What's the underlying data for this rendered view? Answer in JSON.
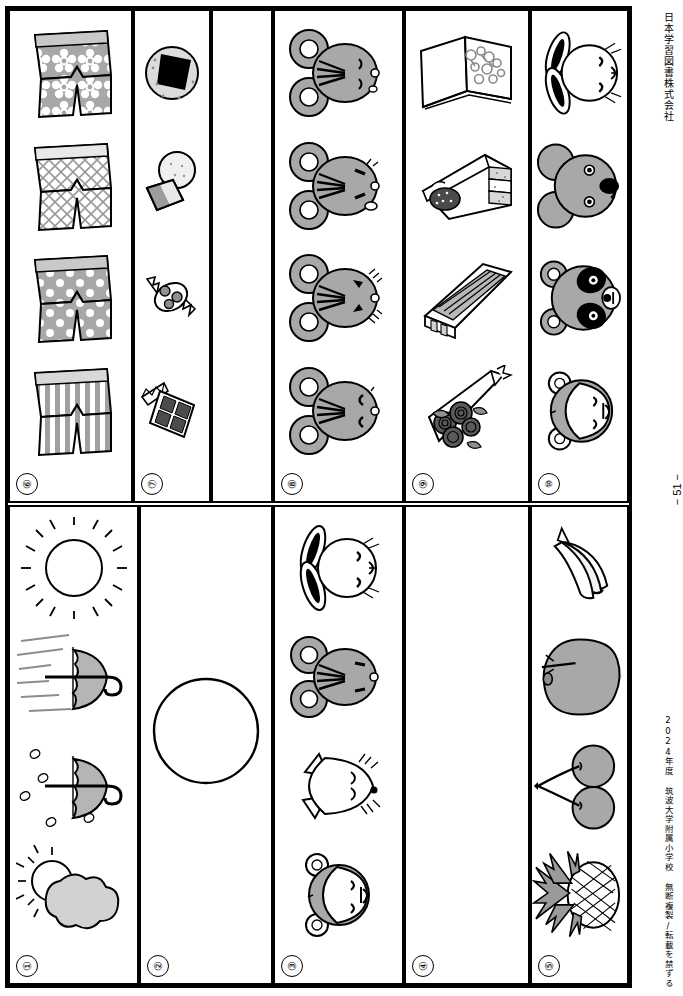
{
  "sheet": {
    "publisher": "日本学習図書株式会社",
    "copyright": "2024年度 筑波大学附属小学校 無断複製/転載を禁ずる",
    "page_number": "− 51 −"
  },
  "bands": [
    {
      "name": "top-band",
      "panels": [
        {
          "id": "panel-6",
          "number": "⑥",
          "theme": "shorts-patterns",
          "items": [
            {
              "name": "shorts-flower-pattern",
              "label": "花柄の半ズボン"
            },
            {
              "name": "shorts-lattice-pattern",
              "label": "格子柄の半ズボン"
            },
            {
              "name": "shorts-polkadot-pattern",
              "label": "水玉の半ズボン"
            },
            {
              "name": "shorts-stripe-pattern",
              "label": "しま模様の半ズボン"
            }
          ]
        },
        {
          "id": "panel-7",
          "number": "⑦",
          "theme": "snacks",
          "items": [
            {
              "name": "onigiri",
              "label": "おにぎり"
            },
            {
              "name": "rice-cracker-and-cake",
              "label": "せんべい"
            },
            {
              "name": "wrapped-candy",
              "label": "あめ"
            },
            {
              "name": "chocolate-bar",
              "label": "チョコレート"
            }
          ]
        },
        {
          "id": "panel-blank",
          "number": "",
          "theme": "blank",
          "items": []
        },
        {
          "id": "panel-8",
          "number": "⑧",
          "theme": "mouse-faces",
          "items": [
            {
              "name": "mouse-face-smiling",
              "label": "ネズミ（笑顔）"
            },
            {
              "name": "mouse-face-surprised",
              "label": "ネズミ（驚き）"
            },
            {
              "name": "mouse-face-crying",
              "label": "ネズミ（泣き）"
            },
            {
              "name": "mouse-face-neutral",
              "label": "ネズミ（すまし顔）"
            }
          ]
        },
        {
          "id": "panel-9",
          "number": "⑨",
          "theme": "gifts",
          "items": [
            {
              "name": "picture-book",
              "label": "絵本"
            },
            {
              "name": "cake-slice",
              "label": "ケーキ"
            },
            {
              "name": "pencil-box",
              "label": "筆箱"
            },
            {
              "name": "flower-bouquet",
              "label": "花束"
            }
          ]
        },
        {
          "id": "panel-10",
          "number": "⑩",
          "theme": "animal-faces",
          "items": [
            {
              "name": "rabbit-face",
              "label": "ウサギ"
            },
            {
              "name": "koala-face",
              "label": "コアラ"
            },
            {
              "name": "panda-face",
              "label": "パンダ"
            },
            {
              "name": "monkey-face",
              "label": "サル"
            }
          ]
        }
      ]
    },
    {
      "name": "bottom-band",
      "panels": [
        {
          "id": "panel-1",
          "number": "①",
          "theme": "weather",
          "items": [
            {
              "name": "sun-icon",
              "label": "晴れ"
            },
            {
              "name": "umbrella-windy-icon",
              "label": "風"
            },
            {
              "name": "umbrella-rain-icon",
              "label": "雨"
            },
            {
              "name": "sun-cloud-icon",
              "label": "くもり"
            }
          ]
        },
        {
          "id": "panel-2",
          "number": "②",
          "theme": "single-circle",
          "items": [
            {
              "name": "empty-circle",
              "label": "〇"
            }
          ]
        },
        {
          "id": "panel-3",
          "number": "③",
          "theme": "animal-faces-outline",
          "items": [
            {
              "name": "rabbit-face",
              "label": "ウサギ"
            },
            {
              "name": "mouse-face",
              "label": "ネズミ"
            },
            {
              "name": "cat-face",
              "label": "ネコ"
            },
            {
              "name": "monkey-face",
              "label": "サル"
            }
          ]
        },
        {
          "id": "panel-4",
          "number": "④",
          "theme": "blank",
          "items": []
        },
        {
          "id": "panel-5",
          "number": "⑤",
          "theme": "fruits",
          "items": [
            {
              "name": "banana",
              "label": "バナナ"
            },
            {
              "name": "apple",
              "label": "リンゴ"
            },
            {
              "name": "cherries",
              "label": "サクランボ"
            },
            {
              "name": "pineapple",
              "label": "パイナップル"
            }
          ]
        }
      ]
    }
  ],
  "colors": {
    "ink": "#000000",
    "grey_fill": "#a8a8a8",
    "light_grey": "#d4d4d4",
    "paper": "#ffffff"
  }
}
